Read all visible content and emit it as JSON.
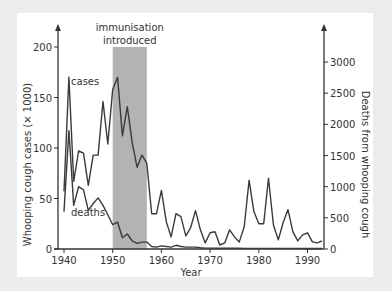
{
  "chart_data": {
    "type": "line",
    "title": "",
    "xlabel": "Year",
    "ylabel": "Whooping cough cases (× 1000)",
    "y2label": "Deaths from whooping cough",
    "xlim": [
      1940,
      1993
    ],
    "ylim": [
      0,
      200
    ],
    "y2lim": [
      0,
      3000
    ],
    "x_ticks": [
      1940,
      1950,
      1960,
      1970,
      1980,
      1990
    ],
    "y_ticks": [
      0,
      50,
      100,
      150,
      200
    ],
    "y2_ticks": [
      0,
      500,
      1000,
      1500,
      2000,
      2500,
      3000
    ],
    "grid": false,
    "shaded_region": {
      "from": 1950,
      "to": 1957,
      "label_lines": [
        "immunisation",
        "introduced"
      ],
      "color": "#b3b3b3"
    },
    "line_color": "#3a3a3a",
    "x": [
      1940,
      1941,
      1942,
      1943,
      1944,
      1945,
      1946,
      1947,
      1948,
      1949,
      1950,
      1951,
      1952,
      1953,
      1954,
      1955,
      1956,
      1957,
      1958,
      1959,
      1960,
      1961,
      1962,
      1963,
      1964,
      1965,
      1966,
      1967,
      1968,
      1969,
      1970,
      1971,
      1972,
      1973,
      1974,
      1975,
      1976,
      1977,
      1978,
      1979,
      1980,
      1981,
      1982,
      1983,
      1984,
      1985,
      1986,
      1987,
      1988,
      1989,
      1990,
      1991,
      1992,
      1993
    ],
    "series": [
      {
        "name": "cases",
        "axis": "left",
        "label": "cases",
        "values": [
          57,
          170,
          67,
          97,
          95,
          63,
          93,
          93,
          146,
          104,
          158,
          170,
          112,
          141,
          105,
          81,
          93,
          85,
          35,
          35,
          58,
          27,
          12,
          35,
          32,
          13,
          21,
          38,
          19,
          6,
          16,
          17,
          4,
          6,
          19,
          12,
          7,
          22,
          68,
          37,
          25,
          25,
          70,
          24,
          9,
          26,
          39,
          17,
          8,
          14,
          16,
          7,
          6,
          8
        ]
      },
      {
        "name": "deaths",
        "axis": "right",
        "label": "deaths",
        "values": [
          600,
          1900,
          700,
          1000,
          950,
          620,
          730,
          820,
          700,
          550,
          390,
          430,
          180,
          240,
          130,
          90,
          110,
          110,
          40,
          30,
          50,
          40,
          30,
          60,
          40,
          30,
          30,
          30,
          20,
          15,
          15,
          14,
          12,
          12,
          12,
          11,
          11,
          10,
          10,
          10,
          10,
          10,
          10,
          10,
          10,
          10,
          9,
          9,
          9,
          8,
          8,
          8,
          8,
          8
        ]
      }
    ]
  }
}
